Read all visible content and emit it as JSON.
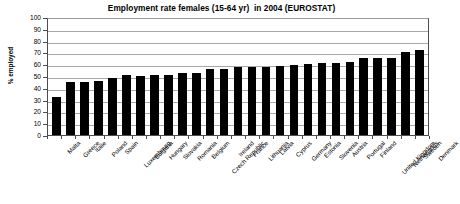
{
  "chart_data": {
    "type": "bar",
    "title": "Employment rate females (15-64 yr)  in 2004 (EUROSTAT)",
    "xlabel": "",
    "ylabel": "% employed",
    "ylim": [
      0,
      100
    ],
    "ytick_step": 10,
    "yticks": [
      "100",
      "90",
      "80",
      "70",
      "60",
      "50",
      "40",
      "30",
      "20",
      "10",
      "0"
    ],
    "grid": true,
    "legend": null,
    "bar_color": "#000000",
    "categories": [
      "Malta",
      "Greece",
      "Italie",
      "Poland",
      "Spain",
      "Luxembourg",
      "Bulgaria",
      "Hungary",
      "Slovakia",
      "Romania",
      "Belgium",
      "Czech Republic",
      "Ireland",
      "France",
      "Lithuania",
      "Latvia",
      "Cyprus",
      "Germany",
      "Estonia",
      "Slovenia",
      "Austria",
      "Portugal",
      "Finland",
      "United Kingdom",
      "Netherlands",
      "Sweden",
      "Denmark"
    ],
    "values": [
      32.5,
      45,
      45,
      46,
      48,
      50.5,
      50,
      50.5,
      50.5,
      52.5,
      52.5,
      56,
      56,
      57.5,
      57.5,
      58,
      58.5,
      59,
      60,
      61,
      61,
      61.5,
      65.5,
      65.5,
      65.5,
      70.5,
      72
    ]
  }
}
